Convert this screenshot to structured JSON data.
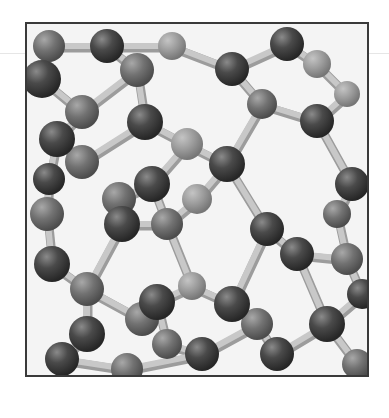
{
  "image": {
    "subject": "ball-and-stick crystal lattice model (diamond cubic structure)",
    "style": "grayscale photograph",
    "colors": {
      "atom_dark": "#3c3c3c",
      "atom_mid": "#6e6e6e",
      "atom_light": "#9a9a9a",
      "bond": "#c8c8c8",
      "bond_shadow": "#9c9c9c",
      "background": "#f4f4f4",
      "frame": "#3a3a3a"
    },
    "frame": {
      "x": 25,
      "y": 22,
      "width": 342,
      "height": 353
    }
  },
  "atoms": [
    {
      "x": 22,
      "y": 22,
      "r": 16,
      "shade": "mid"
    },
    {
      "x": 15,
      "y": 55,
      "r": 19,
      "shade": "dark"
    },
    {
      "x": 80,
      "y": 22,
      "r": 17,
      "shade": "dark"
    },
    {
      "x": 110,
      "y": 46,
      "r": 17,
      "shade": "mid"
    },
    {
      "x": 145,
      "y": 22,
      "r": 14,
      "shade": "light"
    },
    {
      "x": 55,
      "y": 88,
      "r": 17,
      "shade": "mid"
    },
    {
      "x": 30,
      "y": 115,
      "r": 18,
      "shade": "dark"
    },
    {
      "x": 55,
      "y": 138,
      "r": 17,
      "shade": "mid"
    },
    {
      "x": 118,
      "y": 98,
      "r": 18,
      "shade": "dark"
    },
    {
      "x": 205,
      "y": 45,
      "r": 17,
      "shade": "dark"
    },
    {
      "x": 235,
      "y": 80,
      "r": 15,
      "shade": "mid"
    },
    {
      "x": 200,
      "y": 140,
      "r": 18,
      "shade": "dark"
    },
    {
      "x": 260,
      "y": 20,
      "r": 17,
      "shade": "dark"
    },
    {
      "x": 290,
      "y": 40,
      "r": 14,
      "shade": "light"
    },
    {
      "x": 290,
      "y": 97,
      "r": 17,
      "shade": "dark"
    },
    {
      "x": 320,
      "y": 70,
      "r": 13,
      "shade": "light"
    },
    {
      "x": 160,
      "y": 120,
      "r": 16,
      "shade": "light"
    },
    {
      "x": 125,
      "y": 160,
      "r": 18,
      "shade": "dark"
    },
    {
      "x": 92,
      "y": 175,
      "r": 17,
      "shade": "mid"
    },
    {
      "x": 22,
      "y": 155,
      "r": 16,
      "shade": "dark"
    },
    {
      "x": 20,
      "y": 190,
      "r": 17,
      "shade": "mid"
    },
    {
      "x": 95,
      "y": 200,
      "r": 18,
      "shade": "dark"
    },
    {
      "x": 140,
      "y": 200,
      "r": 16,
      "shade": "mid"
    },
    {
      "x": 170,
      "y": 175,
      "r": 15,
      "shade": "light"
    },
    {
      "x": 240,
      "y": 205,
      "r": 17,
      "shade": "dark"
    },
    {
      "x": 270,
      "y": 230,
      "r": 17,
      "shade": "dark"
    },
    {
      "x": 325,
      "y": 160,
      "r": 17,
      "shade": "dark"
    },
    {
      "x": 310,
      "y": 190,
      "r": 14,
      "shade": "mid"
    },
    {
      "x": 320,
      "y": 235,
      "r": 16,
      "shade": "mid"
    },
    {
      "x": 25,
      "y": 240,
      "r": 18,
      "shade": "dark"
    },
    {
      "x": 60,
      "y": 265,
      "r": 17,
      "shade": "mid"
    },
    {
      "x": 115,
      "y": 295,
      "r": 17,
      "shade": "mid"
    },
    {
      "x": 60,
      "y": 310,
      "r": 18,
      "shade": "dark"
    },
    {
      "x": 130,
      "y": 278,
      "r": 18,
      "shade": "dark"
    },
    {
      "x": 165,
      "y": 262,
      "r": 14,
      "shade": "light"
    },
    {
      "x": 205,
      "y": 280,
      "r": 18,
      "shade": "dark"
    },
    {
      "x": 230,
      "y": 300,
      "r": 16,
      "shade": "mid"
    },
    {
      "x": 175,
      "y": 330,
      "r": 17,
      "shade": "dark"
    },
    {
      "x": 140,
      "y": 320,
      "r": 15,
      "shade": "mid"
    },
    {
      "x": 35,
      "y": 335,
      "r": 17,
      "shade": "dark"
    },
    {
      "x": 250,
      "y": 330,
      "r": 17,
      "shade": "dark"
    },
    {
      "x": 300,
      "y": 300,
      "r": 18,
      "shade": "dark"
    },
    {
      "x": 335,
      "y": 270,
      "r": 15,
      "shade": "dark"
    },
    {
      "x": 100,
      "y": 345,
      "r": 16,
      "shade": "mid"
    },
    {
      "x": 330,
      "y": 340,
      "r": 15,
      "shade": "mid"
    }
  ],
  "bonds": [
    [
      0,
      1
    ],
    [
      0,
      2
    ],
    [
      2,
      3
    ],
    [
      2,
      4
    ],
    [
      1,
      5
    ],
    [
      3,
      5
    ],
    [
      3,
      8
    ],
    [
      5,
      6
    ],
    [
      6,
      7
    ],
    [
      7,
      8
    ],
    [
      8,
      16
    ],
    [
      4,
      9
    ],
    [
      9,
      10
    ],
    [
      9,
      12
    ],
    [
      12,
      13
    ],
    [
      10,
      14
    ],
    [
      13,
      15
    ],
    [
      14,
      15
    ],
    [
      10,
      11
    ],
    [
      11,
      16
    ],
    [
      16,
      17
    ],
    [
      17,
      18
    ],
    [
      6,
      19
    ],
    [
      19,
      20
    ],
    [
      18,
      21
    ],
    [
      21,
      22
    ],
    [
      22,
      23
    ],
    [
      17,
      22
    ],
    [
      11,
      23
    ],
    [
      11,
      24
    ],
    [
      24,
      25
    ],
    [
      14,
      26
    ],
    [
      26,
      27
    ],
    [
      27,
      28
    ],
    [
      25,
      28
    ],
    [
      20,
      29
    ],
    [
      29,
      30
    ],
    [
      30,
      31
    ],
    [
      30,
      32
    ],
    [
      21,
      30
    ],
    [
      31,
      33
    ],
    [
      33,
      34
    ],
    [
      34,
      35
    ],
    [
      35,
      36
    ],
    [
      33,
      38
    ],
    [
      38,
      37
    ],
    [
      36,
      37
    ],
    [
      32,
      39
    ],
    [
      39,
      43
    ],
    [
      43,
      37
    ],
    [
      36,
      40
    ],
    [
      40,
      41
    ],
    [
      41,
      42
    ],
    [
      25,
      41
    ],
    [
      28,
      42
    ],
    [
      41,
      44
    ],
    [
      24,
      35
    ],
    [
      22,
      34
    ]
  ]
}
